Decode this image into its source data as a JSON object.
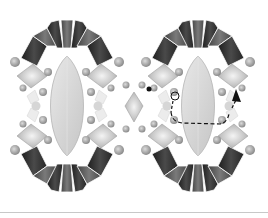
{
  "figure": {
    "type": "beading-diagram",
    "panels": [
      {
        "id": "left",
        "label": "Completed component",
        "center_x": 67,
        "center_y": 106
      },
      {
        "id": "right",
        "label": "Thread path step",
        "center_x": 198,
        "center_y": 106
      }
    ],
    "colors": {
      "dark_trapezoid": "#2e2e2e",
      "mid_trapezoid": "#5a5a5a",
      "navette": "#d8d8d8",
      "navette_edge": "#b4b4b4",
      "square_stone": "#c4c4c4",
      "round_bead": "#9a9a9a",
      "pearl": "#bdbdbd",
      "thread": "#111111",
      "divider": "#c8c8c8"
    },
    "thread_path": {
      "start_dot": [
        149,
        89
      ],
      "arrow_tip": [
        240,
        91
      ],
      "style": "dashed"
    }
  }
}
